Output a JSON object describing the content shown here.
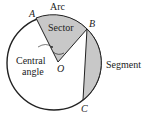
{
  "diagram": {
    "labels": {
      "arc": "Arc",
      "sector": "Sector",
      "segment": "Segment",
      "central_angle_line1": "Central",
      "central_angle_line2": "angle",
      "point_a": "A",
      "point_b": "B",
      "point_c": "C",
      "point_o": "O"
    },
    "colors": {
      "shade": "#c8c8c8",
      "stroke": "#222222"
    }
  }
}
